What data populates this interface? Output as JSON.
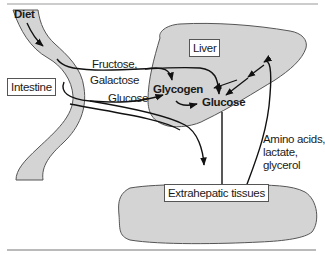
{
  "diagram": {
    "title": "",
    "colors": {
      "organ_fill": "#d4d4d4",
      "organ_stroke": "#555555",
      "arrow": "#111111",
      "rule": "#777777"
    },
    "organs": {
      "intestine": "Intestine",
      "liver": "Liver",
      "extrahepatic": "Extrahepatic tissues"
    },
    "labels": {
      "diet": "Diet",
      "fructose": "Fructose,",
      "galactose": "Galactose",
      "glucose_path": "Glucose",
      "glycogen": "Glycogen",
      "glucose_liver": "Glucose",
      "amino": "Amino acids,",
      "lactate": "lactate,",
      "glycerol": "glycerol"
    },
    "edges": [
      {
        "from": "Diet",
        "to": "Intestine"
      },
      {
        "from": "Intestine",
        "to": "Glycogen",
        "label": "Fructose, Galactose"
      },
      {
        "from": "Intestine",
        "to": "Glucose (liver)",
        "label": "Fructose, Galactose"
      },
      {
        "from": "Intestine",
        "to": "Glycogen",
        "label": "Glucose"
      },
      {
        "from": "Intestine",
        "to": "Extrahepatic tissues",
        "label": "Glucose"
      },
      {
        "from": "Glycogen",
        "to": "Glucose (liver)"
      },
      {
        "from": "Glucose (liver)",
        "to": "Glycogen"
      },
      {
        "from": "Extrahepatic tissues",
        "to": "Glycogen",
        "label": "Amino acids, lactate, glycerol"
      },
      {
        "from": "Extrahepatic tissues",
        "to": "Glucose (liver)",
        "label": "Amino acids, lactate, glycerol"
      },
      {
        "from": "Glucose (liver)",
        "to": "Extrahepatic tissues"
      }
    ]
  }
}
